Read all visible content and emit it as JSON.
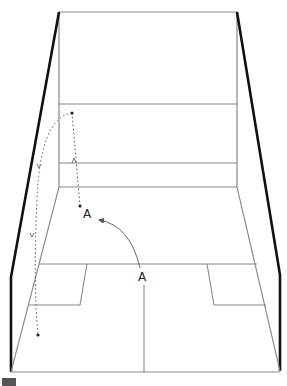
{
  "diagram": {
    "type": "squash court perspective with ball trajectory",
    "colors": {
      "side_wall": "#111111",
      "court_line": "#888888",
      "trajectory": "#555555",
      "arrow": "#666666",
      "swatch": "#555555"
    },
    "labels": {
      "point_a_upper": "A",
      "point_a_lower": "A"
    }
  }
}
